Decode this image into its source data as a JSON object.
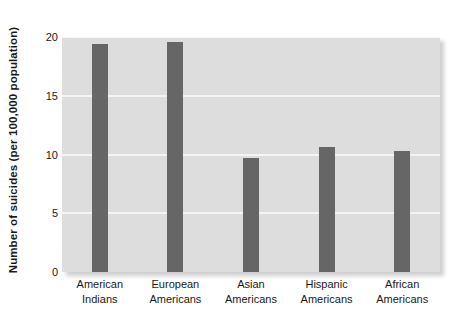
{
  "chart_data": {
    "type": "bar",
    "title": "",
    "subtitle": "",
    "xlabel": "",
    "ylabel": "Number of suicides (per 100,000 population)",
    "categories": [
      "American Indians",
      "European Americans",
      "Asian Americans",
      "Hispanic Americans",
      "African Americans"
    ],
    "category_lines": [
      [
        "American",
        "Indians"
      ],
      [
        "European",
        "Americans"
      ],
      [
        "Asian",
        "Americans"
      ],
      [
        "Hispanic",
        "Americans"
      ],
      [
        "African",
        "Americans"
      ]
    ],
    "values": [
      19.4,
      19.6,
      9.7,
      10.6,
      10.3
    ],
    "ylim": [
      0,
      20
    ],
    "yticks": [
      0,
      5,
      10,
      15,
      20
    ],
    "ytick_labels": [
      "0",
      "5",
      "10",
      "15",
      "20"
    ],
    "grid": true,
    "grid_axis": "y",
    "legend": null,
    "legend_position": "none",
    "colors": {
      "bar": "#666666",
      "plot_background": "#dddddd",
      "gridline": "#f4f4f4",
      "text": "#1a1a1a",
      "figure_background": "#ffffff"
    }
  }
}
